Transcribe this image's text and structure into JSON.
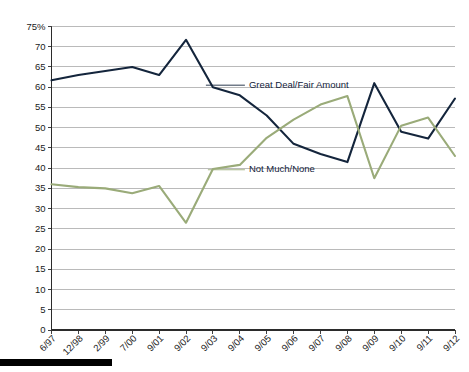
{
  "chart_data": {
    "type": "line",
    "title": "",
    "subtitle": "",
    "xlabel": "",
    "ylabel": "",
    "ylim": [
      0,
      75
    ],
    "ytick_values": [
      0,
      5,
      10,
      15,
      20,
      25,
      30,
      35,
      40,
      45,
      50,
      55,
      60,
      65,
      70,
      75
    ],
    "ytick_labels": [
      "0",
      "5",
      "10",
      "15",
      "20",
      "25",
      "30",
      "35",
      "40",
      "45",
      "50",
      "55",
      "60",
      "65",
      "70",
      "75%"
    ],
    "grid": true,
    "legend_position": "inline-annotations",
    "categories": [
      "6/97",
      "12/98",
      "2/99",
      "7/00",
      "9/01",
      "9/02",
      "9/03",
      "9/04",
      "9/05",
      "9/06",
      "9/07",
      "9/08",
      "9/09",
      "9/10",
      "9/11",
      "9/12"
    ],
    "series": [
      {
        "name": "Great Deal/Fair Amount",
        "color": "#14253c",
        "values": [
          61.7,
          63.0,
          64.0,
          65.0,
          63.0,
          71.7,
          60.0,
          58.0,
          53.0,
          46.0,
          43.5,
          41.5,
          61.0,
          49.0,
          47.3,
          57.2
        ]
      },
      {
        "name": "Not Much/None",
        "color": "#9aab79",
        "values": [
          36.0,
          35.3,
          35.0,
          33.8,
          35.6,
          26.5,
          39.8,
          40.8,
          47.5,
          52.0,
          55.7,
          57.8,
          37.5,
          50.5,
          52.5,
          43.0
        ]
      }
    ],
    "annotations": [
      {
        "text": "Great Deal/Fair Amount",
        "series": "Great Deal/Fair Amount"
      },
      {
        "text": "Not Much/None",
        "series": "Not Much/None"
      }
    ]
  },
  "colors": {
    "great_deal": "#14253c",
    "not_much": "#9aab79",
    "gridline": "#a9a9a9",
    "axis": "#2b2b2b",
    "background": "#ffffff",
    "footer_bar": "#000000"
  }
}
